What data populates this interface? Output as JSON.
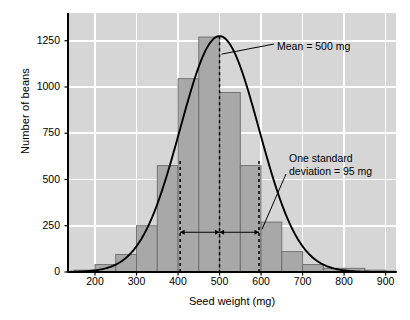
{
  "chart_data": {
    "type": "bar",
    "title": "",
    "xlabel": "Seed weight (mg)",
    "ylabel": "Number of beans",
    "xlim": [
      135,
      925
    ],
    "ylim": [
      0,
      1400
    ],
    "xticks": [
      200,
      300,
      400,
      500,
      600,
      700,
      800,
      900
    ],
    "yticks": [
      0,
      250,
      500,
      750,
      1000,
      1250
    ],
    "grid": true,
    "bin_width": 50,
    "categories": [
      "150-200",
      "200-250",
      "250-300",
      "300-350",
      "350-400",
      "400-450",
      "450-500",
      "500-550",
      "550-600",
      "600-650",
      "650-700",
      "700-750",
      "750-800",
      "800-850",
      "850-900",
      "900-925"
    ],
    "bin_starts": [
      150,
      200,
      250,
      300,
      350,
      400,
      450,
      500,
      550,
      600,
      650,
      700,
      750,
      800,
      850,
      900
    ],
    "values": [
      10,
      40,
      95,
      250,
      575,
      1045,
      1270,
      970,
      575,
      270,
      110,
      40,
      20,
      20,
      10,
      5
    ],
    "overlay_curve": {
      "type": "normal",
      "mean": 500,
      "sd": 95,
      "peak": 1275
    },
    "annotations": [
      {
        "name": "mean-label",
        "text": "Mean = 500 mg",
        "x": 500
      },
      {
        "name": "sd-label",
        "text": "One standard\ndeviation = 95 mg",
        "sd": 95
      }
    ],
    "colors": {
      "plot_background": "#d6d6d6",
      "bar_fill": "#a8a8a8",
      "bar_edge": "#6b6b6b",
      "gridline": "#ffffff",
      "curve": "#000000",
      "axis": "#000000",
      "text": "#000000"
    }
  },
  "axes": {
    "y_title": "Number of beans",
    "x_title": "Seed weight (mg)",
    "y_tick_labels": [
      "1250",
      "1000",
      "750",
      "500",
      "250",
      "0"
    ],
    "x_tick_labels": [
      "200",
      "300",
      "400",
      "500",
      "600",
      "700",
      "800",
      "900"
    ]
  },
  "annotations": {
    "mean": "Mean = 500 mg",
    "sd_line1": "One standard",
    "sd_line2": "deviation = 95 mg"
  }
}
